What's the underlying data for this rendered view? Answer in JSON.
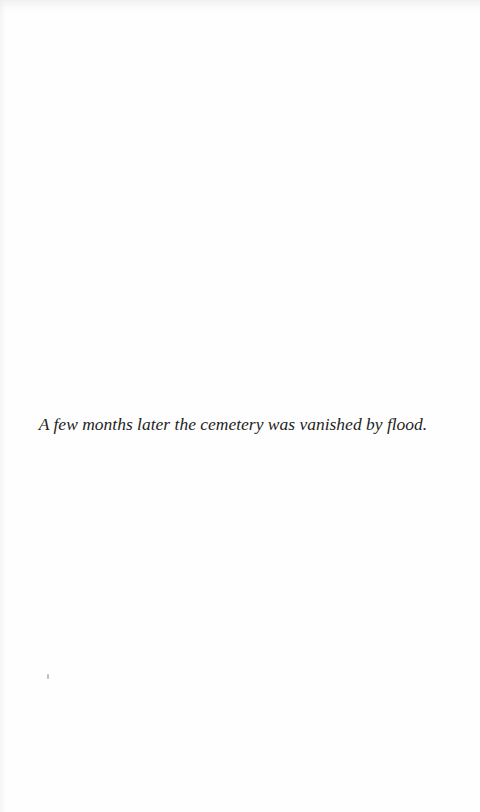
{
  "page": {
    "caption": "A few months later the cemetery was vanished by flood."
  }
}
